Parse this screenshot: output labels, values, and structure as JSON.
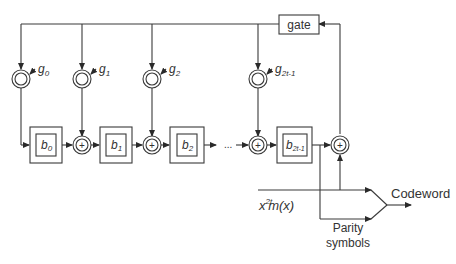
{
  "diagram": {
    "type": "LFSR encoder block diagram (Reed-Solomon / BCH systematic encoder)",
    "gate_label": "gate",
    "multipliers": [
      {
        "label": "g",
        "sub": "0"
      },
      {
        "label": "g",
        "sub": "1"
      },
      {
        "label": "g",
        "sub": "2"
      },
      {
        "label": "g",
        "sub": "2t-1"
      }
    ],
    "registers": [
      {
        "label": "b",
        "sub": "0"
      },
      {
        "label": "b",
        "sub": "1"
      },
      {
        "label": "b",
        "sub": "2"
      },
      {
        "label": "b",
        "sub": "2t-1"
      }
    ],
    "adder_symbol": "+",
    "ellipsis": "...",
    "input_label": {
      "x": "x",
      "sup": "2t",
      "rest": "m(x)"
    },
    "output_label": "Codeword",
    "parity_label_line1": "Parity",
    "parity_label_line2": "symbols",
    "colors": {
      "stroke": "#3a3a3a",
      "text": "#333333",
      "background": "#ffffff"
    }
  }
}
